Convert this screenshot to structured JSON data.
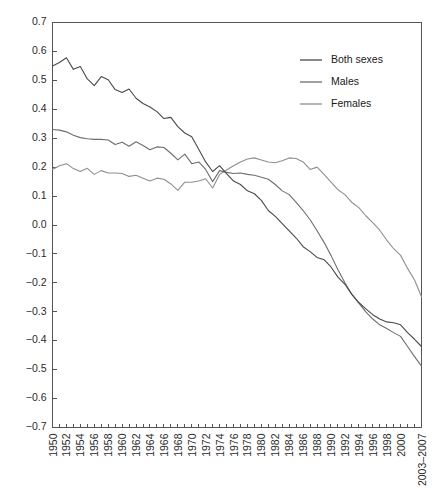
{
  "chart_data": {
    "type": "line",
    "title": "",
    "subtitle": "",
    "xlabel": "",
    "ylabel": "",
    "ylim": [
      -0.7,
      0.7
    ],
    "ytick_labels": [
      "0.7",
      "0.6",
      "0.5",
      "0.4",
      "0.3",
      "0.2",
      "0.1",
      "0.0",
      "−0.1",
      "−0.2",
      "−0.3",
      "−0.4",
      "−0.5",
      "−0.6",
      "−0.7"
    ],
    "ytick_values": [
      0.7,
      0.6,
      0.5,
      0.4,
      0.3,
      0.2,
      0.1,
      0.0,
      -0.1,
      -0.2,
      -0.3,
      -0.4,
      -0.5,
      -0.6,
      -0.7
    ],
    "grid": false,
    "legend_position": "top-right",
    "categories": [
      "1950",
      "1951",
      "1952",
      "1953",
      "1954",
      "1955",
      "1956",
      "1957",
      "1958",
      "1959",
      "1960",
      "1961",
      "1962",
      "1963",
      "1964",
      "1965",
      "1966",
      "1967",
      "1968",
      "1969",
      "1970",
      "1971",
      "1972",
      "1973",
      "1974",
      "1975",
      "1976",
      "1977",
      "1978",
      "1979",
      "1980",
      "1981",
      "1982",
      "1983",
      "1984",
      "1985",
      "1986",
      "1987",
      "1988",
      "1989",
      "1990",
      "1991",
      "1992",
      "1993",
      "1994",
      "1995",
      "1996",
      "1997",
      "1998",
      "1999",
      "2000",
      "2001",
      "2002",
      "2003–2007"
    ],
    "xtick_labels": [
      "1950",
      "1952",
      "1954",
      "1956",
      "1958",
      "1960",
      "1962",
      "1964",
      "1966",
      "1968",
      "1970",
      "1972",
      "1974",
      "1976",
      "1978",
      "1980",
      "1982",
      "1984",
      "1986",
      "1988",
      "1990",
      "1992",
      "1994",
      "1996",
      "1998",
      "2000",
      "2003–2007"
    ],
    "series": [
      {
        "name": "Both sexes",
        "color": "#4a4a4a",
        "values": [
          0.55,
          0.562,
          0.578,
          0.538,
          0.548,
          0.505,
          0.482,
          0.513,
          0.502,
          0.468,
          0.458,
          0.47,
          0.438,
          0.42,
          0.408,
          0.392,
          0.368,
          0.372,
          0.34,
          0.318,
          0.305,
          0.262,
          0.218,
          0.185,
          0.205,
          0.178,
          0.152,
          0.14,
          0.118,
          0.108,
          0.085,
          0.05,
          0.03,
          0.005,
          -0.02,
          -0.045,
          -0.075,
          -0.092,
          -0.112,
          -0.12,
          -0.145,
          -0.18,
          -0.205,
          -0.24,
          -0.268,
          -0.29,
          -0.31,
          -0.325,
          -0.335,
          -0.338,
          -0.345,
          -0.372,
          -0.395,
          -0.42
        ]
      },
      {
        "name": "Males",
        "color": "#6e6e6e",
        "values": [
          0.33,
          0.328,
          0.322,
          0.31,
          0.302,
          0.298,
          0.296,
          0.296,
          0.294,
          0.278,
          0.286,
          0.272,
          0.288,
          0.275,
          0.26,
          0.27,
          0.268,
          0.248,
          0.225,
          0.245,
          0.212,
          0.218,
          0.192,
          0.15,
          0.188,
          0.182,
          0.178,
          0.18,
          0.175,
          0.172,
          0.165,
          0.158,
          0.14,
          0.118,
          0.105,
          0.078,
          0.05,
          0.018,
          -0.02,
          -0.06,
          -0.105,
          -0.155,
          -0.2,
          -0.24,
          -0.27,
          -0.3,
          -0.325,
          -0.345,
          -0.358,
          -0.372,
          -0.385,
          -0.42,
          -0.455,
          -0.488
        ]
      },
      {
        "name": "Females",
        "color": "#8f8f8f",
        "values": [
          0.192,
          0.205,
          0.212,
          0.195,
          0.185,
          0.196,
          0.175,
          0.188,
          0.18,
          0.18,
          0.178,
          0.168,
          0.172,
          0.162,
          0.152,
          0.162,
          0.158,
          0.142,
          0.12,
          0.148,
          0.148,
          0.152,
          0.16,
          0.128,
          0.175,
          0.19,
          0.205,
          0.218,
          0.228,
          0.232,
          0.225,
          0.218,
          0.215,
          0.222,
          0.232,
          0.23,
          0.218,
          0.192,
          0.2,
          0.175,
          0.148,
          0.122,
          0.105,
          0.078,
          0.06,
          0.032,
          0.008,
          -0.018,
          -0.052,
          -0.082,
          -0.105,
          -0.15,
          -0.19,
          -0.248
        ]
      }
    ]
  },
  "legend": {
    "items": [
      {
        "label": "Both sexes"
      },
      {
        "label": "Males"
      },
      {
        "label": "Females"
      }
    ]
  }
}
